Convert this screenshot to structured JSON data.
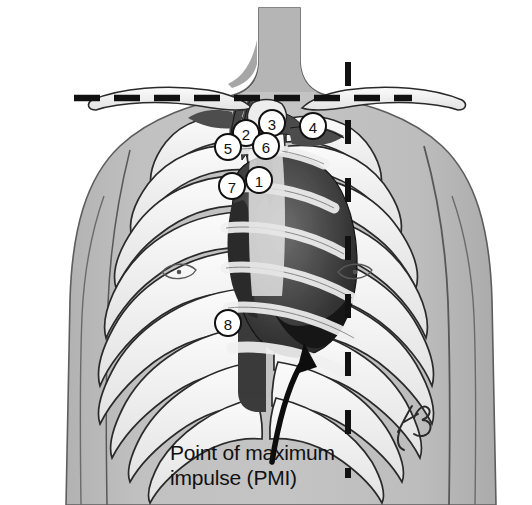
{
  "figure": {
    "background_color": "#ffffff",
    "skin_color": "#bcbcbc",
    "skin_shadow_color": "#a9a9a9",
    "bone_color": "#f2f2f2",
    "bone_outline_color": "#2b2b2b",
    "heart_color": "#3a3a3a",
    "heart_dark_color": "#1c1c1c",
    "vessel_color": "#5a5a5a",
    "line_color": "#111111",
    "label_circle_fill": "#ffffff",
    "label_circle_stroke": "#111111"
  },
  "caption": {
    "line1": "Point of maximum",
    "line2": "impulse (PMI)"
  },
  "signature": {
    "text": "KG"
  },
  "reference_lines": [
    {
      "name": "clavicular-horizontal-line",
      "orientation": "horizontal",
      "style": "dashed",
      "x1": 74,
      "y1": 98,
      "x2": 412,
      "y2": 98
    },
    {
      "name": "midclavicular-vertical-line",
      "orientation": "vertical",
      "style": "dashed",
      "x1": 348,
      "y1": 62,
      "x2": 348,
      "y2": 478
    }
  ],
  "callouts": [
    {
      "id": "1",
      "label": "1",
      "cx": 259,
      "cy": 180,
      "r": 13
    },
    {
      "id": "2",
      "label": "2",
      "cx": 246,
      "cy": 133,
      "r": 13
    },
    {
      "id": "3",
      "label": "3",
      "cx": 272,
      "cy": 123,
      "r": 13
    },
    {
      "id": "4",
      "label": "4",
      "cx": 313,
      "cy": 126,
      "r": 13
    },
    {
      "id": "5",
      "label": "5",
      "cx": 228,
      "cy": 147,
      "r": 13
    },
    {
      "id": "6",
      "label": "6",
      "cx": 266,
      "cy": 146,
      "r": 13
    },
    {
      "id": "7",
      "label": "7",
      "cx": 232,
      "cy": 186,
      "r": 13
    },
    {
      "id": "8",
      "label": "8",
      "cx": 228,
      "cy": 323,
      "r": 13
    }
  ],
  "arrow": {
    "name": "pmi-pointer-arrow",
    "description": "curved black arrow pointing up-left to the apex of the heart",
    "tip_x": 304,
    "tip_y": 345
  }
}
